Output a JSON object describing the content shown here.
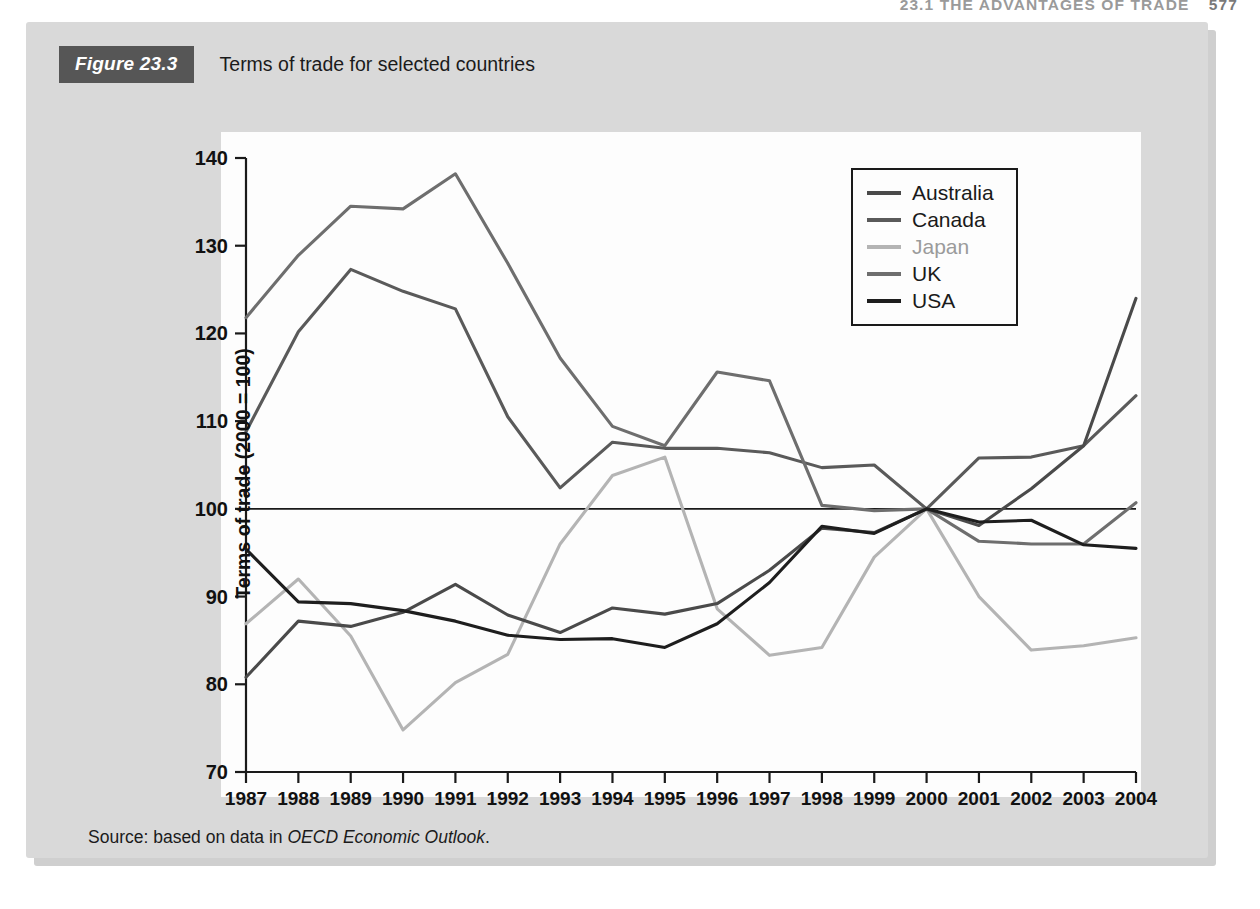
{
  "running_head": {
    "chapter_title": "23.1  THE ADVANTAGES OF TRADE",
    "page_number": "577"
  },
  "figure": {
    "number_label": "Figure 23.3",
    "caption": "Terms of trade for selected countries",
    "source_prefix": "Source: based on data in ",
    "source_italic": "OECD Economic Outlook",
    "source_suffix": "."
  },
  "chart_data": {
    "type": "line",
    "title": "Terms of trade for selected countries",
    "xlabel": "",
    "ylabel": "Terms of trade (2000 = 100)",
    "x": [
      1987,
      1988,
      1989,
      1990,
      1991,
      1992,
      1993,
      1994,
      1995,
      1996,
      1997,
      1998,
      1999,
      2000,
      2001,
      2002,
      2003,
      2004
    ],
    "xtick_labels": [
      "1987",
      "1988",
      "1989",
      "1990",
      "1991",
      "1992",
      "1993",
      "1994",
      "1995",
      "1996",
      "1997",
      "1998",
      "1999",
      "2000",
      "2001",
      "2002",
      "2003",
      "2004"
    ],
    "ytick_labels": [
      "70",
      "80",
      "90",
      "100",
      "110",
      "120",
      "130",
      "140"
    ],
    "ylim": [
      70,
      140
    ],
    "xlim": [
      1987,
      2004
    ],
    "grid": false,
    "legend_position": "upper right",
    "reference_line": 100,
    "series": [
      {
        "name": "Australia",
        "color": "#4a4a4a",
        "values": [
          80.8,
          87.2,
          86.6,
          88.2,
          91.4,
          87.9,
          85.9,
          88.7,
          88.0,
          89.2,
          93.0,
          97.8,
          97.3,
          100.0,
          98.1,
          102.3,
          107.2,
          124.0
        ]
      },
      {
        "name": "Canada",
        "color": "#5a5a5a",
        "values": [
          108.8,
          120.2,
          127.3,
          124.8,
          122.8,
          110.5,
          102.4,
          107.6,
          106.9,
          106.9,
          106.4,
          104.7,
          105.0,
          100.0,
          105.8,
          105.9,
          107.2,
          112.9
        ]
      },
      {
        "name": "Japan",
        "color": "#b4b4b4",
        "values": [
          86.9,
          92.0,
          85.5,
          74.8,
          80.2,
          83.4,
          96.0,
          103.8,
          105.9,
          88.6,
          83.3,
          84.2,
          94.5,
          100.0,
          90.0,
          83.9,
          84.4,
          85.3
        ]
      },
      {
        "name": "UK",
        "color": "#6e6e6e",
        "values": [
          121.8,
          128.9,
          134.5,
          134.2,
          138.2,
          128.0,
          117.2,
          109.4,
          107.2,
          115.6,
          114.6,
          100.4,
          99.8,
          100.0,
          96.3,
          96.0,
          96.0,
          100.7
        ]
      },
      {
        "name": "USA",
        "color": "#1e1e1e",
        "values": [
          95.4,
          89.4,
          89.2,
          88.4,
          87.2,
          85.6,
          85.1,
          85.2,
          84.2,
          86.9,
          91.6,
          98.0,
          97.2,
          100.0,
          98.5,
          98.7,
          95.9,
          95.5
        ]
      }
    ]
  }
}
